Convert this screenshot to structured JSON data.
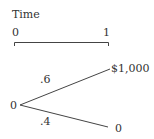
{
  "timeline": {
    "title": "Time",
    "start_label": "0",
    "end_label": "1"
  },
  "tree": {
    "root_value": "0",
    "branches": [
      {
        "probability": ".6",
        "outcome": "$1,000"
      },
      {
        "probability": ".4",
        "outcome": "0"
      }
    ]
  },
  "colors": {
    "line": "#444444",
    "text": "#333333"
  }
}
